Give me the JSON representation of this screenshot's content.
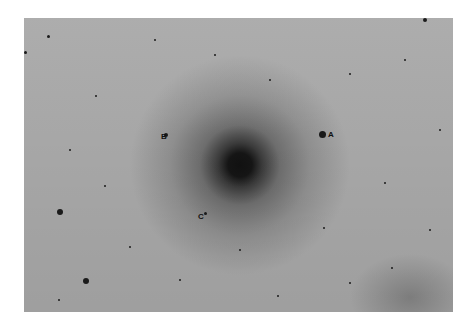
{
  "image": {
    "description": "Negative (inverted) astronomical photograph of a globular star cluster",
    "background_color": "#a7a7a7",
    "core_color": "#111111"
  },
  "labels": [
    {
      "id": "A",
      "text": "A",
      "x": 328,
      "y": 131
    },
    {
      "id": "B",
      "text": "B",
      "x": 161,
      "y": 133
    },
    {
      "id": "C",
      "text": "C",
      "x": 198,
      "y": 213
    }
  ],
  "stars": [
    {
      "x": 322,
      "y": 134,
      "r": 3.5
    },
    {
      "x": 166,
      "y": 135,
      "r": 2
    },
    {
      "x": 205,
      "y": 213,
      "r": 1.5
    },
    {
      "x": 60,
      "y": 212,
      "r": 3
    },
    {
      "x": 86,
      "y": 281,
      "r": 3
    },
    {
      "x": 425,
      "y": 20,
      "r": 2
    },
    {
      "x": 48,
      "y": 36,
      "r": 1.5
    },
    {
      "x": 25,
      "y": 52,
      "r": 1.5
    },
    {
      "x": 155,
      "y": 40,
      "r": 1.2
    },
    {
      "x": 270,
      "y": 80,
      "r": 1.3
    },
    {
      "x": 385,
      "y": 183,
      "r": 1.3
    },
    {
      "x": 324,
      "y": 228,
      "r": 1.3
    },
    {
      "x": 105,
      "y": 186,
      "r": 1.2
    },
    {
      "x": 392,
      "y": 268,
      "r": 1.2
    },
    {
      "x": 278,
      "y": 296,
      "r": 1.2
    },
    {
      "x": 130,
      "y": 247,
      "r": 1
    },
    {
      "x": 59,
      "y": 300,
      "r": 1
    },
    {
      "x": 350,
      "y": 283,
      "r": 1
    },
    {
      "x": 440,
      "y": 130,
      "r": 1
    },
    {
      "x": 96,
      "y": 96,
      "r": 1
    },
    {
      "x": 405,
      "y": 60,
      "r": 1
    },
    {
      "x": 215,
      "y": 55,
      "r": 1
    },
    {
      "x": 350,
      "y": 74,
      "r": 1
    },
    {
      "x": 180,
      "y": 280,
      "r": 1
    },
    {
      "x": 240,
      "y": 250,
      "r": 1.1
    },
    {
      "x": 70,
      "y": 150,
      "r": 1
    },
    {
      "x": 430,
      "y": 230,
      "r": 1
    }
  ]
}
